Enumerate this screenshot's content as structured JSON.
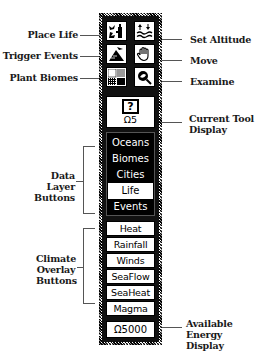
{
  "callouts": {
    "place_life": "Place Life",
    "trigger_events": "Trigger Events",
    "plant_biomes": "Plant Biomes",
    "set_altitude": "Set Altitude",
    "move": "Move",
    "examine": "Examine",
    "current_tool_line1": "Current Tool",
    "current_tool_line2": "Display",
    "data_layer_line1": "Data Layer",
    "data_layer_line2": "Buttons",
    "climate_line1": "Climate",
    "climate_line2": "Overlay",
    "climate_line3": "Buttons",
    "energy_line1": "Available",
    "energy_line2": "Energy Display"
  },
  "tools": [
    {
      "name": "place-life",
      "icon": "place-life-icon"
    },
    {
      "name": "set-altitude",
      "icon": "set-altitude-icon"
    },
    {
      "name": "trigger-events",
      "icon": "trigger-events-icon"
    },
    {
      "name": "move",
      "icon": "hand-icon"
    },
    {
      "name": "plant-biomes",
      "icon": "biomes-icon"
    },
    {
      "name": "examine",
      "icon": "magnifier-icon"
    }
  ],
  "current_tool": {
    "icon_glyph": "?",
    "cost": "Ω5"
  },
  "data_layers": [
    {
      "label": "Oceans",
      "selected": false
    },
    {
      "label": "Biomes",
      "selected": false
    },
    {
      "label": "Cities",
      "selected": false
    },
    {
      "label": "Life",
      "selected": true
    },
    {
      "label": "Events",
      "selected": false
    }
  ],
  "climate_overlays": [
    {
      "label": "Heat"
    },
    {
      "label": "Rainfall"
    },
    {
      "label": "Winds"
    },
    {
      "label": "SeaFlow"
    },
    {
      "label": "SeaHeat"
    },
    {
      "label": "Magma"
    }
  ],
  "energy": {
    "value": "Ω5000"
  }
}
